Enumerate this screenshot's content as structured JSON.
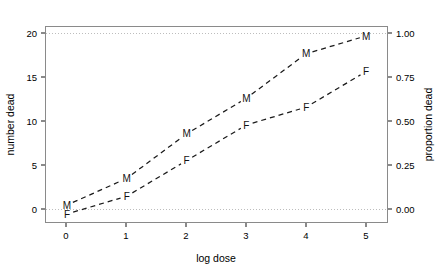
{
  "chart_data": {
    "type": "line",
    "title": "",
    "subtitle": "",
    "xlabel": "log dose",
    "ylabel": "number dead",
    "y2label": "proportion dead",
    "x": [
      0,
      1,
      2,
      3,
      4,
      5
    ],
    "xlim": [
      -0.35,
      5.35
    ],
    "ylim": [
      -0.9,
      21.0
    ],
    "y2lim": [
      -0.045,
      1.05
    ],
    "xticks": [
      0,
      1,
      2,
      3,
      4,
      5
    ],
    "xticklabels": [
      "0",
      "1",
      "2",
      "3",
      "4",
      "5"
    ],
    "yticks": [
      0,
      5,
      10,
      15,
      20
    ],
    "yticklabels": [
      "0",
      "5",
      "10",
      "15",
      "20"
    ],
    "y2ticks": [
      0.0,
      0.25,
      0.5,
      0.75,
      1.0
    ],
    "y2ticklabels": [
      "0.00",
      "0.25",
      "0.50",
      "0.75",
      "1.00"
    ],
    "grid": "horizontal-dotted-at-0-and-20",
    "legend": "none (points labelled in place)",
    "total_per_group": 20,
    "series": [
      {
        "name": "M",
        "marker_label": "M",
        "values": [
          1,
          4,
          9,
          13,
          18,
          20
        ],
        "proportions": [
          0.05,
          0.2,
          0.45,
          0.65,
          0.9,
          1.0
        ],
        "linestyle": "dashed",
        "color": "#1a1a1a"
      },
      {
        "name": "F",
        "marker_label": "F",
        "values": [
          0,
          2,
          6,
          10,
          12,
          16
        ],
        "proportions": [
          0.0,
          0.1,
          0.3,
          0.5,
          0.6,
          0.8
        ],
        "linestyle": "dashed",
        "color": "#1a1a1a"
      }
    ],
    "annotations": [
      {
        "series": "M",
        "x": 0,
        "y": 1,
        "text": "M"
      },
      {
        "series": "M",
        "x": 1,
        "y": 4,
        "text": "M"
      },
      {
        "series": "M",
        "x": 2,
        "y": 9,
        "text": "M"
      },
      {
        "series": "M",
        "x": 3,
        "y": 13,
        "text": "M"
      },
      {
        "series": "M",
        "x": 4,
        "y": 18,
        "text": "M"
      },
      {
        "series": "M",
        "x": 5,
        "y": 20,
        "text": "M"
      },
      {
        "series": "F",
        "x": 0,
        "y": 0,
        "text": "F"
      },
      {
        "series": "F",
        "x": 1,
        "y": 2,
        "text": "F"
      },
      {
        "series": "F",
        "x": 2,
        "y": 6,
        "text": "F"
      },
      {
        "series": "F",
        "x": 3,
        "y": 10,
        "text": "F"
      },
      {
        "series": "F",
        "x": 4,
        "y": 12,
        "text": "F"
      },
      {
        "series": "F",
        "x": 5,
        "y": 16,
        "text": "F"
      }
    ],
    "colors": {
      "background": "#ffffff",
      "frame": "#8a8a8a",
      "gridline": "#bdbdbd",
      "data": "#1a1a1a",
      "text": "#000000"
    }
  }
}
